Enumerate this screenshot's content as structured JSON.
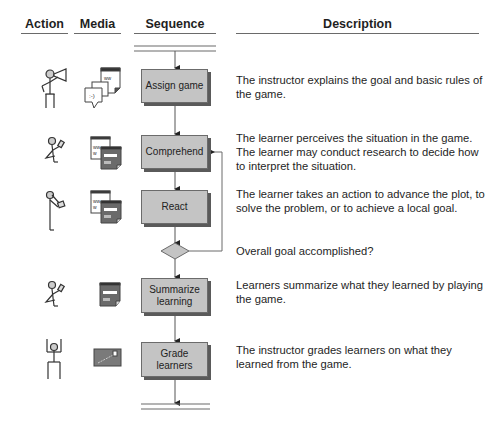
{
  "headers": {
    "action": "Action",
    "media": "Media",
    "sequence": "Sequence",
    "description": "Description"
  },
  "steps": [
    {
      "label": "Assign game",
      "action_icon": "instructor-megaphone-icon",
      "media_icon": "chat-and-web-page-icon",
      "description": "The instructor explains the goal and basic rules of the game."
    },
    {
      "label": "Comprehend",
      "action_icon": "learner-reading-icon",
      "media_icon": "web-page-and-form-icon",
      "description": "The learner perceives the situation in the game. The learner may conduct research to decide how to interpret the situation."
    },
    {
      "label": "React",
      "action_icon": "learner-acting-icon",
      "media_icon": "web-page-and-form-icon",
      "description": "The learner takes an action to advance the plot, to solve the problem, or to achieve a local goal."
    },
    {
      "label": "Summarize learning",
      "action_icon": "learner-writing-icon",
      "media_icon": "form-icon",
      "description": "Learners summarize what they learned by playing the game."
    },
    {
      "label": "Grade learners",
      "action_icon": "instructor-arms-raised-icon",
      "media_icon": "grade-certificate-icon",
      "description": "The instructor grades learners on what they learned from the game."
    }
  ],
  "decision": {
    "question": "Overall goal accomplished?",
    "loop_target": "Comprehend"
  },
  "colors": {
    "box_fill": "#c4c4c4",
    "box_shadow": "#5a5a5a",
    "line": "#6a6a6a"
  }
}
